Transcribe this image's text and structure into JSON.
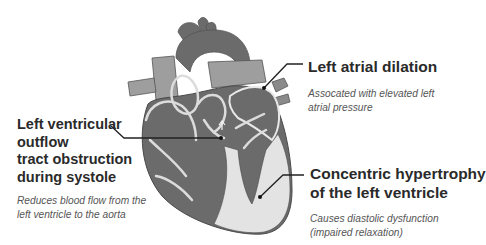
{
  "diagram": {
    "colors": {
      "background": "#ffffff",
      "heart_dark": "#6b6b6b",
      "heart_mid": "#8a8a8a",
      "heart_vessel_light": "#9e9e9e",
      "heart_light_wall": "#e3e3e3",
      "outline": "#4a4a4a",
      "leader_line": "#222222",
      "title_text": "#2a2a2a",
      "sub_text": "#555555"
    },
    "annotations": [
      {
        "id": "left-atrial-dilation",
        "title_lines": [
          "Left atrial dilation"
        ],
        "description_lines": [
          "Assocated with elevated left",
          "atrial pressure"
        ]
      },
      {
        "id": "lvot-obstruction",
        "title_lines": [
          "Left ventricular",
          "outflow",
          "tract obstruction",
          "during systole"
        ],
        "description_lines": [
          "Reduces blood flow from the",
          "left ventricle to the aorta"
        ]
      },
      {
        "id": "concentric-hypertrophy",
        "title_lines": [
          "Concentric hypertrophy",
          "of the left ventricle"
        ],
        "description_lines": [
          "Causes diastolic dysfunction",
          "(impaired relaxation)"
        ]
      }
    ]
  }
}
